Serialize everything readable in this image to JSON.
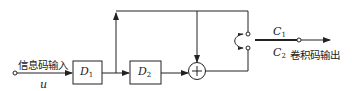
{
  "diagram": {
    "title": "",
    "input_label": "信息码输入",
    "input_symbol": "u",
    "blocks": [
      {
        "id": "D1",
        "name": "D",
        "sub": "1"
      },
      {
        "id": "D2",
        "name": "D",
        "sub": "2"
      }
    ],
    "adder_symbol": "+",
    "outputs": [
      {
        "name": "C",
        "sub": "1"
      },
      {
        "name": "C",
        "sub": "2"
      }
    ],
    "output_label": "卷积码输出",
    "colors": {
      "line": "#222222",
      "background": "#ffffff"
    }
  }
}
